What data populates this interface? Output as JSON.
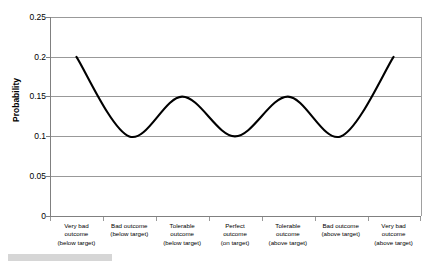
{
  "chart_data": {
    "type": "line",
    "title": "",
    "xlabel": "",
    "ylabel": "Probability",
    "ylim": [
      0,
      0.25
    ],
    "grid": true,
    "legend": "none",
    "categories": [
      "Very bad outcome (below target)",
      "Bad outcome (below target)",
      "Tolerable outcome (below target)",
      "Perfect outcome (on target)",
      "Tolerable outcome (above target)",
      "Bad outcome (above target)",
      "Very bad outcome (above target)"
    ],
    "values": [
      0.2,
      0.1,
      0.15,
      0.1,
      0.15,
      0.1,
      0.2
    ],
    "series": [
      {
        "name": "Probability",
        "values": [
          0.2,
          0.1,
          0.15,
          0.1,
          0.15,
          0.1,
          0.2
        ],
        "color": "#000000"
      }
    ],
    "ytick_labels": [
      "0",
      "0.05",
      "0.1",
      "0.15",
      "0.2",
      "0.25"
    ],
    "ytick_values": [
      0,
      0.05,
      0.1,
      0.15,
      0.2,
      0.25
    ]
  },
  "axis": {
    "y_title": "Probability",
    "y_ticks": [
      {
        "label": "0.25",
        "value": 0.25
      },
      {
        "label": "0.2",
        "value": 0.2
      },
      {
        "label": "0.15",
        "value": 0.15
      },
      {
        "label": "0.1",
        "value": 0.1
      },
      {
        "label": "0.05",
        "value": 0.05
      },
      {
        "label": "0",
        "value": 0
      }
    ],
    "x_categories": [
      {
        "line1": "Very bad",
        "line2": "outcome",
        "line3": "(below target)"
      },
      {
        "line1": "Bad outcome",
        "line2": "(below target)",
        "line3": ""
      },
      {
        "line1": "Tolerable",
        "line2": "outcome",
        "line3": "(below target)"
      },
      {
        "line1": "Perfect",
        "line2": "outcome",
        "line3": "(on target)"
      },
      {
        "line1": "Tolerable",
        "line2": "outcome",
        "line3": "(above target)"
      },
      {
        "line1": "Bad outcome",
        "line2": "(above target)",
        "line3": ""
      },
      {
        "line1": "Very bad",
        "line2": "outcome",
        "line3": "(above target)"
      }
    ]
  },
  "colors": {
    "curve": "#000000",
    "gridline": "#999999",
    "axis": "#808080",
    "background": "#ffffff",
    "footer_bar": "#d6d6d6"
  }
}
